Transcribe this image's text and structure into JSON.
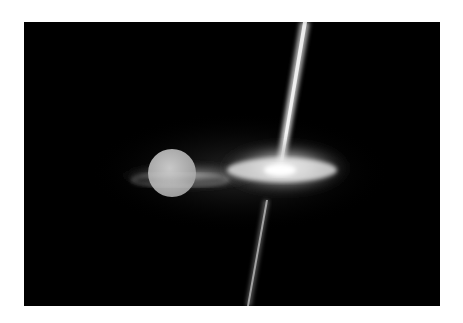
{
  "image": {
    "description": "Artist illustration of a binary system: a ringed star/planet with an accretion disk beside a compact object emitting bipolar jets",
    "colors": {
      "background": "#000000",
      "border": "#ffffff",
      "glow": "#e8e8e8",
      "sphere": "#b4b4b4"
    },
    "elements": [
      {
        "name": "companion-sphere",
        "cx": 172,
        "cy": 173,
        "r": 24
      },
      {
        "name": "left-disk",
        "cx": 190,
        "cy": 176,
        "rx": 78,
        "ry": 14
      },
      {
        "name": "accretion-disk",
        "cx": 280,
        "cy": 168,
        "rx": 62,
        "ry": 22
      },
      {
        "name": "top-jet",
        "x1": 305,
        "y1": 22,
        "x2": 280,
        "y2": 170
      },
      {
        "name": "bottom-jet",
        "x1": 266,
        "y1": 205,
        "x2": 248,
        "y2": 306
      }
    ]
  }
}
